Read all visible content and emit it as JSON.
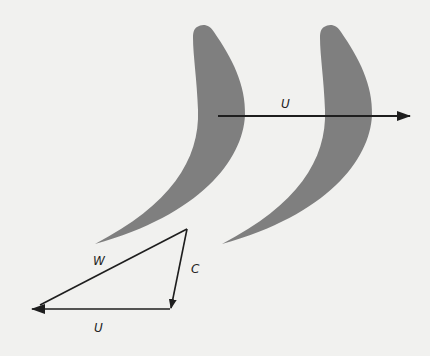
{
  "diagram": {
    "colors": {
      "background": "#f1f1ef",
      "blade": "#7f7f7f",
      "line": "#1e1e1e"
    },
    "blades": [
      {
        "name": "blade-1",
        "offset_x": 0
      },
      {
        "name": "blade-2",
        "offset_x": 127
      }
    ],
    "blade_velocity_arrow": {
      "label": "U",
      "x1": 218,
      "y1": 116,
      "x2": 410,
      "y2": 116
    },
    "velocity_triangle": {
      "vertices": {
        "top": [
          187,
          229
        ],
        "bottom_right": [
          170,
          309
        ],
        "left": [
          30,
          309
        ]
      },
      "labels": {
        "relative": "W",
        "absolute": "C",
        "blade": "U"
      }
    }
  }
}
